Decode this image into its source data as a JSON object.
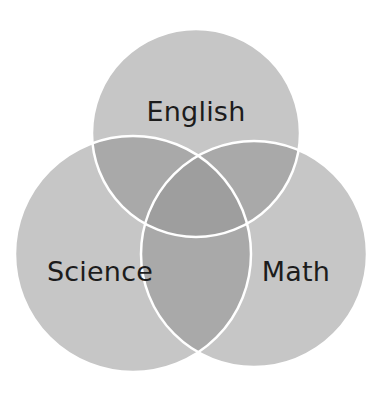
{
  "figure": {
    "type": "venn-diagram",
    "title": "",
    "background_color": "#ffffff",
    "set_count": 3
  },
  "chart_data": {
    "type": "venn",
    "title": "",
    "background": "#ffffff",
    "sets": [
      {
        "id": "english",
        "label": "English",
        "position": "top",
        "cx": 196,
        "cy": 133,
        "r": 104,
        "fill": "#c6c6c6",
        "stroke": "#ffffff",
        "label_x": 196,
        "label_y": 113,
        "label_color": "#1c1c1c",
        "label_size": 27
      },
      {
        "id": "science",
        "label": "Science",
        "position": "bottom-left",
        "cx": 133,
        "cy": 254,
        "r": 118,
        "fill": "#c6c6c6",
        "stroke": "#ffffff",
        "label_x": 100,
        "label_y": 273,
        "label_color": "#1c1c1c",
        "label_size": 27
      },
      {
        "id": "math",
        "label": "Math",
        "position": "bottom-right",
        "cx": 254,
        "cy": 254,
        "r": 113,
        "fill": "#c6c6c6",
        "stroke": "#ffffff",
        "label_x": 296,
        "label_y": 273,
        "label_color": "#1c1c1c",
        "label_size": 27
      }
    ],
    "regions": [
      {
        "id": "english-only",
        "sets": [
          "english"
        ],
        "label": "",
        "fill": "#c6c6c6"
      },
      {
        "id": "science-only",
        "sets": [
          "science"
        ],
        "label": "",
        "fill": "#c6c6c6"
      },
      {
        "id": "math-only",
        "sets": [
          "math"
        ],
        "label": "",
        "fill": "#c6c6c6"
      },
      {
        "id": "english-science",
        "sets": [
          "english",
          "science"
        ],
        "label": "",
        "fill": "#a9a9a9"
      },
      {
        "id": "english-math",
        "sets": [
          "english",
          "math"
        ],
        "label": "",
        "fill": "#a9a9a9"
      },
      {
        "id": "science-math",
        "sets": [
          "science",
          "math"
        ],
        "label": "",
        "fill": "#a9a9a9"
      },
      {
        "id": "all-three",
        "sets": [
          "english",
          "science",
          "math"
        ],
        "label": "",
        "fill": "#9e9e9e"
      }
    ],
    "colors": {
      "single_fill": "#c6c6c6",
      "pair_fill": "#a9a9a9",
      "triple_fill": "#9e9e9e",
      "outline": "#ffffff",
      "label_text": "#1c1c1c",
      "background": "#ffffff"
    },
    "stroke_width": 2.5,
    "legend": null,
    "axis": null,
    "grid": false
  }
}
